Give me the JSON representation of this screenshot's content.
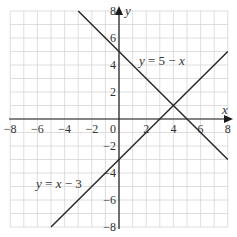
{
  "chart_data": {
    "type": "line",
    "title": "",
    "xlabel": "x",
    "ylabel": "y",
    "xlim": [
      -8,
      8
    ],
    "ylim": [
      -8,
      8
    ],
    "grid": true,
    "x_ticks": [
      -8,
      -6,
      -4,
      -2,
      0,
      2,
      4,
      6,
      8
    ],
    "y_ticks": [
      8,
      6,
      4,
      2,
      -2,
      -4,
      -6,
      -8
    ],
    "x_tick_labels": [
      "−8",
      "−6",
      "−4",
      "−2",
      "0",
      "2",
      "4",
      "6",
      "8"
    ],
    "y_tick_labels": [
      "8",
      "6",
      "4",
      "2",
      "−2",
      "−4",
      "−6",
      "−8"
    ],
    "series": [
      {
        "name": "y = 5 − x",
        "equation": "y = 5 - x",
        "x": [
          -3,
          8
        ],
        "y": [
          8,
          -3
        ],
        "label_position": [
          2,
          6.5
        ]
      },
      {
        "name": "y = x − 3",
        "equation": "y = x - 3",
        "x": [
          -5,
          8
        ],
        "y": [
          -8,
          5
        ],
        "label_position": [
          -6,
          -5
        ]
      }
    ],
    "intersection": {
      "x": 4,
      "y": 1
    }
  },
  "labels": {
    "x_axis": "x",
    "y_axis": "y",
    "eq1_y": "y",
    "eq1_rest": " = 5 − ",
    "eq1_x": "x",
    "eq2_y": "y",
    "eq2_mid": " = ",
    "eq2_x": "x",
    "eq2_rest": " − 3"
  }
}
